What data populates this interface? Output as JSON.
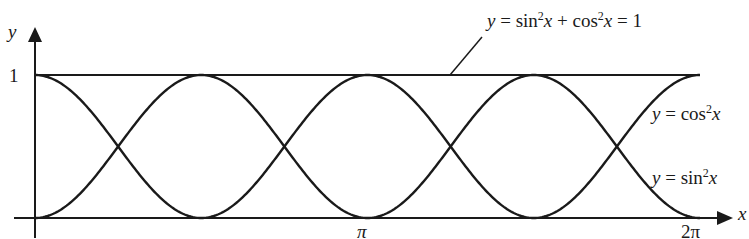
{
  "chart_data": {
    "type": "line",
    "title": "",
    "xlabel": "x",
    "ylabel": "y",
    "xlim": [
      0,
      6.2832
    ],
    "ylim": [
      0,
      1
    ],
    "x_ticks": [
      {
        "value": 3.1416,
        "label": "π"
      },
      {
        "value": 6.2832,
        "label": "2π"
      }
    ],
    "y_ticks": [
      {
        "value": 1,
        "label": "1"
      }
    ],
    "grid": false,
    "series": [
      {
        "name": "y = cos²x",
        "expr": "cos2",
        "start_value": 1,
        "peaks_at_x_px": [
          35,
          200,
          367,
          533,
          700
        ]
      },
      {
        "name": "y = sin²x",
        "expr": "sin2",
        "start_value": 0,
        "peaks_at_x_px": [
          118,
          284,
          450,
          617
        ]
      },
      {
        "name": "y = sin²x + cos²x = 1",
        "expr": "one",
        "constant": 1
      }
    ],
    "annotations": [
      {
        "text": "y = sin²x + cos²x = 1",
        "points_to": "horizontal line y=1"
      },
      {
        "text": "y = cos²x",
        "position": "right, upper"
      },
      {
        "text": "y = sin²x",
        "position": "right, lower"
      }
    ]
  },
  "labels": {
    "y_axis": "y",
    "x_axis": "x",
    "y_one": "1",
    "pi": "π",
    "two_pi": "2π",
    "identity": {
      "pre": "y",
      "eq1": " = sin",
      "sup1": "2",
      "x1": "x",
      "plus": " + cos",
      "sup2": "2",
      "x2": "x",
      "eq2": " = 1"
    },
    "cos_label": {
      "y": "y",
      "eq": " = cos",
      "sup": "2",
      "x": "x"
    },
    "sin_label": {
      "y": "y",
      "eq": " = sin",
      "sup": "2",
      "x": "x"
    }
  }
}
